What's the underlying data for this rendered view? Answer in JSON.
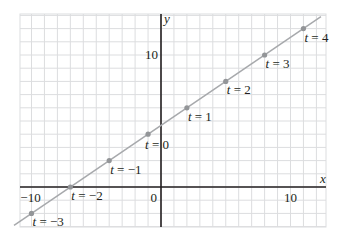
{
  "chart_data": {
    "type": "line",
    "title": "",
    "xlabel": "x",
    "ylabel": "y",
    "xlim": [
      -10.7,
      12.7
    ],
    "ylim": [
      -3,
      13.1
    ],
    "grid": true,
    "grid_step": 1,
    "x_ticks": [
      {
        "value": -10,
        "label": "−10"
      },
      {
        "value": 0,
        "label": "0"
      },
      {
        "value": 10,
        "label": "10"
      }
    ],
    "y_ticks": [
      {
        "value": 10,
        "label": "10"
      }
    ],
    "equation": {
      "x": "-1 + 3t",
      "y": "4 + 2t"
    },
    "series": [
      {
        "name": "parametric line",
        "color": "#a7a9ac",
        "points": [
          {
            "t": -3,
            "x": -10,
            "y": -2,
            "label": "t = −3"
          },
          {
            "t": -2,
            "x": -7,
            "y": 0,
            "label": "t = −2"
          },
          {
            "t": -1,
            "x": -4,
            "y": 2,
            "label": "t = −1"
          },
          {
            "t": 0,
            "x": -1,
            "y": 4,
            "label": "t = 0"
          },
          {
            "t": 1,
            "x": 2,
            "y": 6,
            "label": "t = 1"
          },
          {
            "t": 2,
            "x": 5,
            "y": 8,
            "label": "t = 2"
          },
          {
            "t": 3,
            "x": 8,
            "y": 10,
            "label": "t = 3"
          },
          {
            "t": 4,
            "x": 11,
            "y": 12,
            "label": "t = 4"
          }
        ]
      }
    ]
  },
  "colors": {
    "grid": "#dcdddf",
    "axis": "#231f20",
    "line": "#a7a9ac",
    "point": "#939598"
  }
}
